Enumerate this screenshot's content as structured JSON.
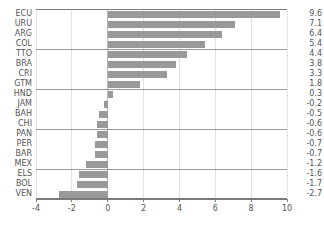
{
  "chart_data": {
    "type": "bar",
    "orientation": "horizontal",
    "title": "",
    "subtitle": "",
    "xlabel": "",
    "ylabel": "",
    "categories": [
      "ECU",
      "URU",
      "ARG",
      "COL",
      "TTO",
      "BRA",
      "CRI",
      "GTM",
      "HND",
      "JAM",
      "BAH",
      "CHI",
      "PAN",
      "PER",
      "BAR",
      "MEX",
      "ELS",
      "BOL",
      "VEN"
    ],
    "values": [
      9.6,
      7.1,
      6.4,
      5.4,
      4.4,
      3.8,
      3.3,
      1.8,
      0.3,
      -0.2,
      -0.5,
      -0.6,
      -0.6,
      -0.7,
      -0.7,
      -1.2,
      -1.6,
      -1.7,
      -2.7
    ],
    "value_labels": [
      "9.6",
      "7.1",
      "6.4",
      "5.4",
      "4.4",
      "3.8",
      "3.3",
      "1.8",
      "0.3",
      "-0.2",
      "-0.5",
      "-0.6",
      "-0.6",
      "-0.7",
      "-0.7",
      "-1.2",
      "-1.6",
      "-1.7",
      "-2.7"
    ],
    "xlim": [
      -4,
      10
    ],
    "xticks": [
      -4,
      -2,
      0,
      2,
      4,
      6,
      8,
      10
    ],
    "xticklabels": [
      "-4",
      "-2",
      "0",
      "2",
      "4",
      "6",
      "8",
      "10"
    ],
    "grid": "vertical-only",
    "legend": "none",
    "group_separators_after": [
      4,
      8,
      12,
      16
    ],
    "bar_color": "#999999",
    "grid_color": "#e2e2e2",
    "axis_color": "#7a7a7a",
    "text_color": "#555555"
  }
}
